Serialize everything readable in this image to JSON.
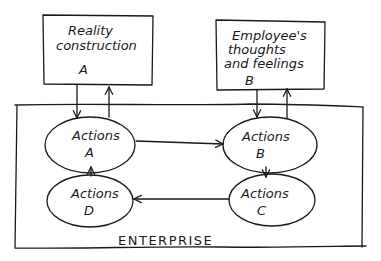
{
  "diagram": {
    "type": "flow",
    "colors": {
      "stroke": "#1a1a1a",
      "background": "#ffffff"
    },
    "boxes": [
      {
        "id": "box-a",
        "lines": [
          "Reality",
          "construction"
        ],
        "letter": "A"
      },
      {
        "id": "box-b",
        "lines": [
          "Employee's",
          "thoughts",
          "and feelings"
        ],
        "letter": "B"
      }
    ],
    "container": {
      "label": "ENTERPRISE"
    },
    "nodes": [
      {
        "id": "actions-a",
        "label": "Actions",
        "letter": "A"
      },
      {
        "id": "actions-b",
        "label": "Actions",
        "letter": "B"
      },
      {
        "id": "actions-c",
        "label": "Actions",
        "letter": "C"
      },
      {
        "id": "actions-d",
        "label": "Actions",
        "letter": "D"
      }
    ],
    "edges": [
      {
        "from": "box-a",
        "to": "actions-a"
      },
      {
        "from": "actions-a",
        "to": "box-a"
      },
      {
        "from": "box-b",
        "to": "actions-b"
      },
      {
        "from": "actions-b",
        "to": "box-b"
      },
      {
        "from": "actions-a",
        "to": "actions-b"
      },
      {
        "from": "actions-b",
        "to": "actions-c"
      },
      {
        "from": "actions-c",
        "to": "actions-d"
      },
      {
        "from": "actions-d",
        "to": "actions-a"
      }
    ]
  }
}
